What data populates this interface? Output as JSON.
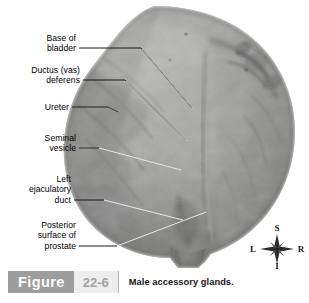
{
  "figure": {
    "badge_label": "Figure",
    "number": "22-6",
    "caption": "Male accessory glands."
  },
  "labels": [
    {
      "id": "base-of-bladder",
      "text": "Base of\nbladder"
    },
    {
      "id": "ductus-vas-deferens",
      "text": "Ductus (vas)\ndeferens"
    },
    {
      "id": "ureter",
      "text": "Ureter"
    },
    {
      "id": "seminal-vesicle",
      "text": "Seminal\nvesicle"
    },
    {
      "id": "left-ejaculatory-duct",
      "text": "Left\nejaculatory\nduct"
    },
    {
      "id": "posterior-surface-of-prostate",
      "text": "Posterior\nsurface of\nprostate"
    }
  ],
  "compass": {
    "superior": "S",
    "inferior": "I",
    "left": "L",
    "right": "R"
  },
  "colors": {
    "background": "#ffffff",
    "badge_gray": "#9d9d9d",
    "number_box_gray": "#ededed",
    "number_text_gray": "#a2a2a2",
    "label_text": "#000000",
    "leader_dark": "#1a1a1a",
    "leader_light": "#e8e8e8"
  }
}
